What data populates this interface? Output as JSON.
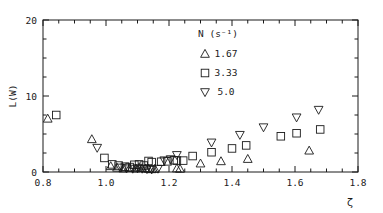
{
  "figure": {
    "background": "#ffffff",
    "ink": "#1a1a1a",
    "plot_box": {
      "left": 43,
      "top": 20,
      "right": 358,
      "bottom": 172
    }
  },
  "chart_data": {
    "type": "scatter",
    "title": "",
    "xlabel": "ζ",
    "ylabel": "L(W)",
    "xlim": [
      0.8,
      1.8
    ],
    "ylim": [
      0,
      20
    ],
    "xticks": [
      0.8,
      1.0,
      1.2,
      1.4,
      1.6,
      1.8
    ],
    "xticklabels": [
      "0.8",
      "1.0",
      "1.2",
      "1.4",
      "1.6",
      "1.8"
    ],
    "yticks": [
      0,
      10,
      20
    ],
    "yticklabels": [
      "0",
      "10",
      "20"
    ],
    "xminor_step": 0.05,
    "yminor_step": 2.5,
    "grid": false,
    "tick_direction": "in",
    "legend": {
      "position": "upper center",
      "title": "N  (s⁻¹)",
      "entries": [
        {
          "marker": "triangle-up",
          "label": "1.67"
        },
        {
          "marker": "square",
          "label": "3.33"
        },
        {
          "marker": "triangle-down",
          "label": "5.0"
        }
      ]
    },
    "series": [
      {
        "name": "1.67",
        "marker": "triangle-up",
        "points": [
          [
            0.815,
            7.0
          ],
          [
            0.955,
            4.3
          ],
          [
            1.015,
            0.75
          ],
          [
            1.035,
            0.55
          ],
          [
            1.055,
            0.45
          ],
          [
            1.075,
            0.5
          ],
          [
            1.095,
            0.45
          ],
          [
            1.105,
            0.55
          ],
          [
            1.115,
            0.5
          ],
          [
            1.125,
            0.45
          ],
          [
            1.135,
            0.4
          ],
          [
            1.145,
            0.35
          ],
          [
            1.155,
            0.4
          ],
          [
            1.225,
            0.45
          ],
          [
            1.235,
            0.4
          ],
          [
            1.3,
            1.1
          ],
          [
            1.365,
            1.4
          ],
          [
            1.45,
            1.7
          ],
          [
            1.645,
            2.8
          ]
        ]
      },
      {
        "name": "3.33",
        "marker": "square",
        "points": [
          [
            0.842,
            7.5
          ],
          [
            0.995,
            1.85
          ],
          [
            1.02,
            1.0
          ],
          [
            1.04,
            0.85
          ],
          [
            1.06,
            0.7
          ],
          [
            1.075,
            0.65
          ],
          [
            1.09,
            0.95
          ],
          [
            1.105,
            1.0
          ],
          [
            1.12,
            0.85
          ],
          [
            1.135,
            1.45
          ],
          [
            1.145,
            1.3
          ],
          [
            1.175,
            1.35
          ],
          [
            1.195,
            1.4
          ],
          [
            1.215,
            1.55
          ],
          [
            1.225,
            1.5
          ],
          [
            1.245,
            1.5
          ],
          [
            1.275,
            2.1
          ],
          [
            1.335,
            2.6
          ],
          [
            1.4,
            3.1
          ],
          [
            1.445,
            3.5
          ],
          [
            1.555,
            4.7
          ],
          [
            1.605,
            5.1
          ],
          [
            1.68,
            5.6
          ]
        ]
      },
      {
        "name": "5.0",
        "marker": "triangle-down",
        "points": [
          [
            0.972,
            3.2
          ],
          [
            1.045,
            0.6
          ],
          [
            1.065,
            0.5
          ],
          [
            1.085,
            0.45
          ],
          [
            1.1,
            0.5
          ],
          [
            1.115,
            0.45
          ],
          [
            1.13,
            0.4
          ],
          [
            1.145,
            0.35
          ],
          [
            1.165,
            0.45
          ],
          [
            1.185,
            1.55
          ],
          [
            1.205,
            1.7
          ],
          [
            1.225,
            2.25
          ],
          [
            1.335,
            3.9
          ],
          [
            1.425,
            4.9
          ],
          [
            1.5,
            5.9
          ],
          [
            1.605,
            7.2
          ],
          [
            1.675,
            8.2
          ]
        ]
      }
    ]
  }
}
